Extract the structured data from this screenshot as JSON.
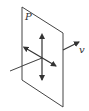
{
  "diagram": {
    "plane_label": "P",
    "velocity_label": "v",
    "colors": {
      "stroke": "#444444",
      "background": "#ffffff"
    },
    "elements": [
      "plane-parallelogram",
      "vertical-double-arrow",
      "diagonal-double-arrow",
      "propagation-line",
      "velocity-arrow"
    ]
  }
}
